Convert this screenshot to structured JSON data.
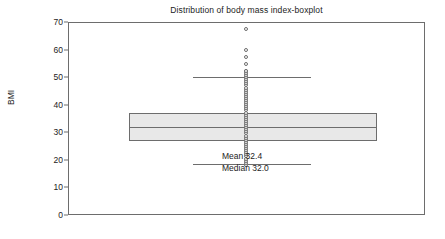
{
  "chart_data": {
    "type": "boxplot",
    "title": "Distribution of body mass index-boxplot",
    "xlabel": "",
    "ylabel": "BMI",
    "ylim": [
      0,
      70
    ],
    "yticks": [
      0,
      10,
      20,
      30,
      40,
      50,
      60,
      70
    ],
    "grid": false,
    "legend": null,
    "orientation": "vertical-scale-horizontal-box",
    "box": {
      "q1": 27.0,
      "median": 32.0,
      "q3": 37.0,
      "whisker_low": 18.5,
      "whisker_high": 50.0
    },
    "outliers_above": [
      67.5,
      59.8,
      57.2,
      54.8,
      52.3
    ],
    "outlier_strip": {
      "description": "dense column of individual data points plotted at the box centre",
      "min": 18.2,
      "max": 52.3,
      "count": 46
    },
    "annotations": [
      "Mean 32.4",
      "Median 32.0"
    ],
    "statistics": {
      "mean": 32.4,
      "median": 32.0
    },
    "colors": {
      "line": "#6d6d6d",
      "box_fill": "#e8e8e8",
      "text": "#1c1c1c",
      "background": "#ffffff"
    }
  },
  "figure": {
    "title": "Distribution of body mass index-boxplot",
    "y_axis_title": "BMI",
    "y_tick_labels": [
      "70",
      "60",
      "50",
      "40",
      "30",
      "20",
      "10",
      "0"
    ],
    "annotation_mean": "Mean 32.4",
    "annotation_median": "Median 32.0"
  }
}
